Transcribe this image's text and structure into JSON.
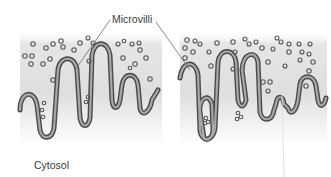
{
  "labels": {
    "microvilli": "Microvilli",
    "cytosol": "Cytosol"
  },
  "panels": [
    {
      "name": "left-panel",
      "description": "Membrane surface with microvilli and extracellular vesicles"
    },
    {
      "name": "right-panel",
      "description": "Membrane surface with elongated microvilli enclosing vesicles"
    }
  ],
  "colors": {
    "membrane_outer": "#4a4a4a",
    "membrane_inner": "#9a9a9a",
    "vesicle": "#555555",
    "background_gradient_top": "#d8d8d8",
    "background_gradient_bottom": "#ffffff",
    "leader_line": "#6a6a6a"
  }
}
